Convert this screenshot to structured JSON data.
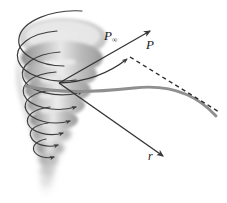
{
  "figure": {
    "background_color": "#ffffff",
    "ink_color": "#333333",
    "funnel_fill_light": "#e6e6e6",
    "funnel_fill_mid": "#c4c4c4",
    "funnel_fill_dark": "#9a9a9a",
    "streamline_color": "#8c8c8c"
  },
  "labels": {
    "p_infinity": {
      "base": "P",
      "subscript": "∞",
      "name": "free-stream point label"
    },
    "p": {
      "base": "P",
      "name": "point label"
    },
    "r": {
      "base": "r",
      "name": "radius vector label"
    }
  },
  "annotations": {
    "vector_p_infinity": "arrow to P-infinity",
    "vector_r": "radius arrow r",
    "asymptote": "dashed asymptote line",
    "streamline": "curved streamline",
    "swirl_arrows": "spiral circulation arrows"
  },
  "vortex": {
    "type": "tornado-funnel",
    "loops": 7,
    "description": "tapering spiral funnel with descending circulation loops"
  }
}
